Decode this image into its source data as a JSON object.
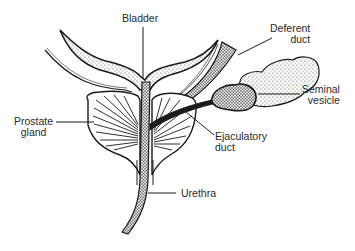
{
  "diagram": {
    "colors": {
      "ink": "#1a1a1a",
      "background": "#ffffff",
      "stipple": "#555555"
    },
    "labels": {
      "bladder": {
        "line1": "Bladder"
      },
      "deferent_duct": {
        "line1": "Deferent",
        "line2": "duct"
      },
      "seminal_vesicle": {
        "line1": "Seminal",
        "line2": "vesicle"
      },
      "prostate_gland": {
        "line1": "Prostate",
        "line2": "gland"
      },
      "ejaculatory_duct": {
        "line1": "Ejaculatory",
        "line2": "duct"
      },
      "urethra": {
        "line1": "Urethra"
      }
    }
  }
}
